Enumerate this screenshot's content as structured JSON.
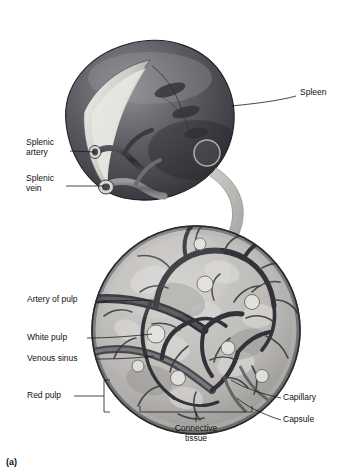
{
  "figure": {
    "panel_id": "(a)",
    "title_visible": false,
    "labels": [
      {
        "id": "spleen",
        "text": "Spleen",
        "side": "right",
        "x": 300,
        "y": 92,
        "leader": [
          [
            296,
            97
          ],
          [
            258,
            102
          ],
          [
            230,
            105
          ]
        ]
      },
      {
        "id": "splenic-artery",
        "text": "Splenic\nartery",
        "side": "left",
        "x": 26,
        "y": 142,
        "leader": [
          [
            78,
            152
          ],
          [
            95,
            155
          ]
        ]
      },
      {
        "id": "splenic-vein",
        "text": "Splenic\nvein",
        "side": "left",
        "x": 26,
        "y": 178,
        "leader": [
          [
            74,
            186
          ],
          [
            104,
            186
          ]
        ]
      },
      {
        "id": "artery-of-pulp",
        "text": "Artery of pulp",
        "side": "left",
        "x": 27,
        "y": 297,
        "leader": [
          [
            110,
            301
          ],
          [
            152,
            299
          ]
        ]
      },
      {
        "id": "white-pulp",
        "text": "White pulp",
        "side": "left",
        "x": 27,
        "y": 335,
        "leader": [
          [
            92,
            339
          ],
          [
            150,
            334
          ]
        ]
      },
      {
        "id": "venous-sinus",
        "text": "Venous sinus",
        "side": "left",
        "x": 27,
        "y": 356,
        "leader": [
          [
            101,
            360
          ],
          [
            152,
            356
          ]
        ]
      },
      {
        "id": "red-pulp",
        "text": "Red pulp",
        "side": "left",
        "x": 27,
        "y": 392,
        "leader": [
          [
            80,
            396
          ],
          [
            104,
            396
          ]
        ]
      },
      {
        "id": "capillary",
        "text": "Capillary",
        "side": "right",
        "x": 283,
        "y": 396,
        "leader": [
          [
            280,
            400
          ],
          [
            250,
            392
          ],
          [
            230,
            382
          ]
        ]
      },
      {
        "id": "capsule",
        "text": "Capsule",
        "side": "right",
        "x": 283,
        "y": 418,
        "leader": [
          [
            280,
            422
          ],
          [
            255,
            412
          ],
          [
            239,
            400
          ]
        ]
      },
      {
        "id": "connective-tissue",
        "text": "Connective\ntissue",
        "side": "center",
        "x": 175,
        "y": 427,
        "leader": [
          [
            196,
            425
          ],
          [
            205,
            412
          ],
          [
            212,
            398
          ]
        ]
      }
    ],
    "colors": {
      "organ_dark": "#3f3f44",
      "organ_mid": "#6e6e74",
      "organ_light": "#b9b9bd",
      "hilum": "#d8d6d2",
      "vessel_dark": "#2e2e33",
      "vessel_mid": "#77777e",
      "circle_bg": "#c9c7c4",
      "pulp_light": "#e4e2de",
      "arrow": "#b0aeab",
      "leader_line": "#1a1a1a",
      "text": "#111111",
      "background": "#ffffff"
    },
    "brackets": {
      "red_pulp_bracket": {
        "x": 104,
        "y_top": 380,
        "y_bottom": 412,
        "tick": 6
      },
      "connective_tissue_bracket": {
        "x_left": 140,
        "x_right": 252,
        "y": 412,
        "tick": 6
      }
    }
  }
}
